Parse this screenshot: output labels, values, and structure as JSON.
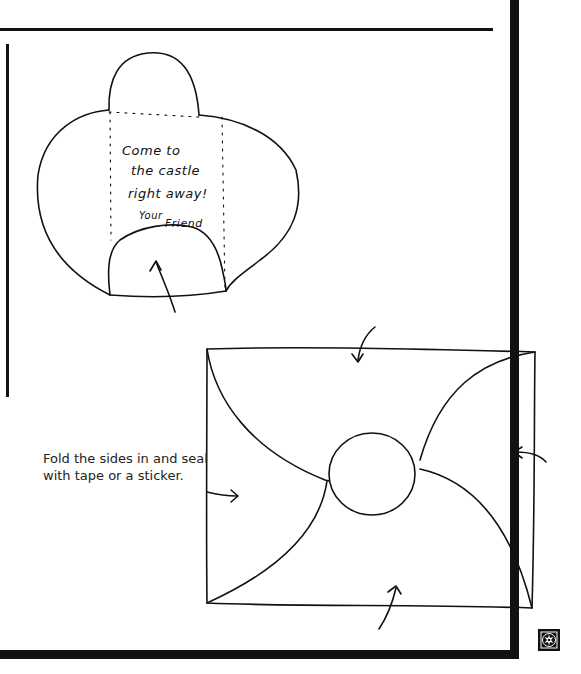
{
  "page": {
    "kind": "craft-instructions",
    "accent_color": "#111111",
    "background_color": "#ffffff"
  },
  "letter_drawing": {
    "message_lines": [
      "Come to",
      "the castle",
      "right away!"
    ],
    "signature_prefix": "Your",
    "signature_name": "Friend"
  },
  "envelope_drawing": {
    "instruction_text": "Fold the sides in and seal with tape or a sticker."
  },
  "decorations": {
    "corner_ornament": "ornament-icon",
    "arrows": [
      "arrow-up-icon",
      "arrow-down-icon",
      "arrow-right-icon",
      "arrow-left-icon",
      "arrow-up-icon"
    ]
  }
}
